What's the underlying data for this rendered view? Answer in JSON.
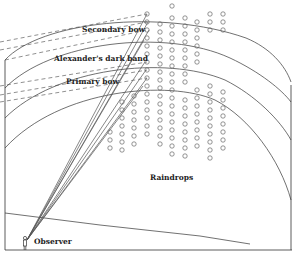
{
  "diagram": {
    "labels": {
      "secondary_bow": "Secondary bow",
      "dark_band": "Alexander's dark band",
      "primary_bow": "Primary bow",
      "raindrops": "Raindrops",
      "observer": "Observer"
    },
    "colors": {
      "line": "#333333",
      "ray": "#555555",
      "drop": "#666666",
      "background": "#ffffff"
    },
    "drop_columns": [
      {
        "x": 147,
        "ys": [
          14,
          22,
          30,
          38,
          46,
          54,
          62,
          70,
          78,
          86,
          94
        ]
      },
      {
        "x": 160,
        "ys": [
          24,
          32,
          40,
          48,
          56,
          64,
          72,
          80,
          88
        ]
      },
      {
        "x": 172,
        "ys": [
          6,
          18,
          26,
          34,
          42,
          50,
          58,
          66,
          74,
          82,
          90
        ]
      },
      {
        "x": 185,
        "ys": [
          18,
          26,
          34,
          42,
          50,
          58,
          66,
          74,
          82
        ]
      },
      {
        "x": 197,
        "ys": [
          22,
          30,
          38,
          46,
          54,
          62
        ]
      },
      {
        "x": 210,
        "ys": [
          14,
          22,
          30
        ]
      },
      {
        "x": 223,
        "ys": [
          14,
          22,
          30
        ]
      },
      {
        "x": 122,
        "ys": [
          102,
          110,
          118,
          126,
          134,
          142
        ]
      },
      {
        "x": 134,
        "ys": [
          96,
          104,
          112,
          120,
          128,
          136,
          144
        ]
      },
      {
        "x": 147,
        "ys": [
          102,
          110,
          118,
          126,
          134
        ]
      },
      {
        "x": 160,
        "ys": [
          96,
          104,
          112,
          120,
          128,
          136,
          144
        ]
      },
      {
        "x": 172,
        "ys": [
          98,
          106,
          114,
          122,
          130,
          138,
          146,
          154
        ]
      },
      {
        "x": 185,
        "ys": [
          100,
          108,
          116,
          124,
          132,
          140,
          148,
          156
        ]
      },
      {
        "x": 197,
        "ys": [
          90,
          98,
          106,
          114,
          122,
          130,
          138,
          146
        ]
      },
      {
        "x": 210,
        "ys": [
          86,
          94,
          102,
          110,
          118,
          126,
          134,
          142,
          150,
          158
        ]
      },
      {
        "x": 223,
        "ys": [
          92,
          100,
          108,
          116,
          124,
          132,
          140,
          148
        ]
      },
      {
        "x": 110,
        "ys": [
          132,
          140,
          148
        ]
      },
      {
        "x": 122,
        "ys": [
          150
        ]
      }
    ]
  }
}
